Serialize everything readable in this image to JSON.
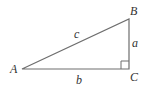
{
  "diagram": {
    "type": "right-triangle",
    "stroke_color": "#6e6e6e",
    "label_color": "#333333",
    "vertices": [
      {
        "name": "A",
        "x": 22,
        "y": 69,
        "label_x": 10,
        "label_y": 73
      },
      {
        "name": "B",
        "x": 129,
        "y": 19,
        "label_x": 130,
        "label_y": 15
      },
      {
        "name": "C",
        "x": 129,
        "y": 69,
        "label_x": 130,
        "label_y": 81
      }
    ],
    "sides": [
      {
        "name": "a",
        "from": "B",
        "to": "C",
        "label_x": 132,
        "label_y": 47
      },
      {
        "name": "b",
        "from": "A",
        "to": "C",
        "label_x": 76,
        "label_y": 84
      },
      {
        "name": "c",
        "from": "A",
        "to": "B",
        "label_x": 74,
        "label_y": 38
      }
    ],
    "right_angle_at": "C"
  }
}
